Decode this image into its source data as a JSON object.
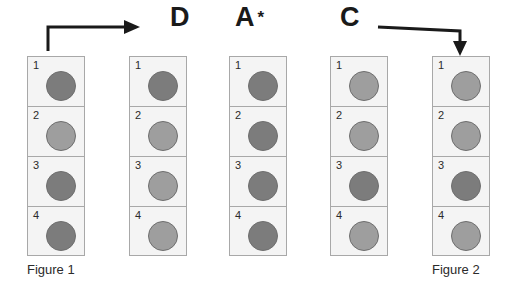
{
  "figure": {
    "background_color": "#ffffff",
    "cell_fill_color": "#f4f4f4",
    "cell_border_color": "#a8a8a8",
    "disc_border_color": "#6e6e6e",
    "dark_disc_color": "#7c7c7c",
    "light_disc_color": "#9e9e9e",
    "arrow_color": "#1a1a1a"
  },
  "labels": {
    "d": "D",
    "a": "A",
    "a_star": "*",
    "c": "C",
    "figure_1": "Figure 1",
    "figure_2": "Figure 2"
  },
  "columns": [
    {
      "id": "figure-1",
      "caption": "Figure 1",
      "header": "",
      "cells": [
        {
          "number": "1",
          "shade": "dark"
        },
        {
          "number": "2",
          "shade": "light"
        },
        {
          "number": "3",
          "shade": "dark"
        },
        {
          "number": "4",
          "shade": "dark"
        }
      ]
    },
    {
      "id": "step-d",
      "caption": "",
      "header": "D",
      "cells": [
        {
          "number": "1",
          "shade": "dark"
        },
        {
          "number": "2",
          "shade": "light"
        },
        {
          "number": "3",
          "shade": "light"
        },
        {
          "number": "4",
          "shade": "light"
        }
      ]
    },
    {
      "id": "step-a-star",
      "caption": "",
      "header": "A *",
      "cells": [
        {
          "number": "1",
          "shade": "dark"
        },
        {
          "number": "2",
          "shade": "dark"
        },
        {
          "number": "3",
          "shade": "dark"
        },
        {
          "number": "4",
          "shade": "dark"
        }
      ]
    },
    {
      "id": "step-c",
      "caption": "",
      "header": "C",
      "cells": [
        {
          "number": "1",
          "shade": "light"
        },
        {
          "number": "2",
          "shade": "light"
        },
        {
          "number": "3",
          "shade": "dark"
        },
        {
          "number": "4",
          "shade": "light"
        }
      ]
    },
    {
      "id": "figure-2",
      "caption": "Figure 2",
      "header": "",
      "cells": [
        {
          "number": "1",
          "shade": "light"
        },
        {
          "number": "2",
          "shade": "light"
        },
        {
          "number": "3",
          "shade": "dark"
        },
        {
          "number": "4",
          "shade": "light"
        }
      ]
    }
  ]
}
